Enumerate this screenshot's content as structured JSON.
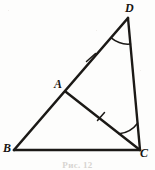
{
  "figure": {
    "caption": "Рис. 12",
    "stroke_color": "#1b1916",
    "background_color": "#fdfdfc",
    "vertices": [
      {
        "name": "D",
        "label": "D",
        "x": 128,
        "y": 18
      },
      {
        "name": "A",
        "label": "A",
        "x": 66,
        "y": 92
      },
      {
        "name": "B",
        "label": "B",
        "x": 14,
        "y": 150
      },
      {
        "name": "C",
        "label": "C",
        "x": 140,
        "y": 150
      }
    ],
    "segments": [
      {
        "name": "segment-BD",
        "from": "B",
        "to": "D"
      },
      {
        "name": "segment-BC",
        "from": "B",
        "to": "C"
      },
      {
        "name": "segment-DC",
        "from": "D",
        "to": "C"
      },
      {
        "name": "segment-AC",
        "from": "A",
        "to": "C"
      }
    ],
    "tick_marks": [
      {
        "name": "tick-AD",
        "on_segment": "AD",
        "x": 91,
        "y": 57,
        "count": 1
      },
      {
        "name": "tick-AC",
        "on_segment": "AC",
        "x": 101,
        "y": 117,
        "count": 1
      }
    ],
    "angle_arcs": [
      {
        "name": "angle-D",
        "at_vertex": "D",
        "between": "DB and DC"
      },
      {
        "name": "angle-C",
        "at_vertex": "C",
        "between": "CA and CD"
      }
    ]
  }
}
